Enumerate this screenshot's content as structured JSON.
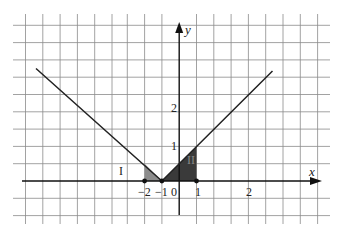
{
  "diagram": {
    "axes": {
      "x_label": "x",
      "y_label": "y",
      "x_ticks": [
        "−2",
        "−1",
        "0",
        "1",
        "2"
      ],
      "y_ticks": [
        "1",
        "2"
      ]
    },
    "regions": [
      {
        "name": "I",
        "label": "I",
        "vertices": [
          [
            -2,
            0
          ],
          [
            -2,
            1
          ],
          [
            -1,
            0
          ]
        ],
        "color": "#8c8c8c"
      },
      {
        "name": "II",
        "label": "II",
        "vertices": [
          [
            -1,
            0
          ],
          [
            1,
            2
          ],
          [
            1,
            0
          ]
        ],
        "color": "#3a3a3a"
      }
    ],
    "points": [
      [
        -2,
        0
      ],
      [
        -1,
        0
      ],
      [
        1,
        0
      ]
    ],
    "function": "y = |x + 1|",
    "colors": {
      "grid": "#7a7a7a",
      "axis": "#111111",
      "line": "#222222"
    }
  }
}
